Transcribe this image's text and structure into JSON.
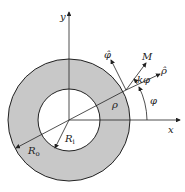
{
  "diagram": {
    "type": "annular-ring-coordinate-diagram",
    "colors": {
      "ring_fill": "#c8c8c8",
      "line": "#222222",
      "background": "#ffffff"
    },
    "labels": {
      "y_axis": "y",
      "x_axis": "x",
      "phi_hat": "φ̂",
      "rho_hat": "ρ̂",
      "M": "M",
      "k_phi": "kφ",
      "rho": "ρ",
      "phi": "φ",
      "R_i_main": "R",
      "R_i_sub": "i",
      "R_o_main": "R",
      "R_o_sub": "o"
    }
  }
}
